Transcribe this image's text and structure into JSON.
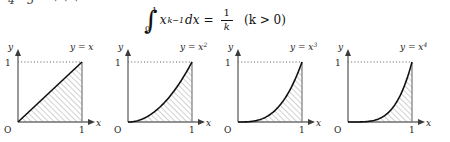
{
  "top_fragment": {
    "visible_digits": [
      "4",
      "5"
    ],
    "trailing_dots": "· · ·"
  },
  "formula": {
    "integral_symbol": "∫",
    "lower_limit": "0",
    "upper_limit": "1",
    "integrand_base": "x",
    "integrand_exponent": "k−1",
    "differential": "dx",
    "equals": "=",
    "result_numerator": "1",
    "result_denominator": "k",
    "condition": "(k > 0)"
  },
  "panels": [
    {
      "id": "panel-y-equals-x",
      "curve_label_lhs": "y = x",
      "curve_label_exponent": "",
      "exponent": 1,
      "y_axis_label": "y",
      "x_axis_label": "x",
      "origin_label": "O",
      "y_tick_label": "1",
      "x_tick_label": "1"
    },
    {
      "id": "panel-y-equals-x2",
      "curve_label_lhs": "y = x",
      "curve_label_exponent": "2",
      "exponent": 2,
      "y_axis_label": "y",
      "x_axis_label": "x",
      "origin_label": "O",
      "y_tick_label": "1",
      "x_tick_label": "1"
    },
    {
      "id": "panel-y-equals-x3",
      "curve_label_lhs": "y = x",
      "curve_label_exponent": "3",
      "exponent": 3,
      "y_axis_label": "y",
      "x_axis_label": "x",
      "origin_label": "O",
      "y_tick_label": "1",
      "x_tick_label": "1"
    },
    {
      "id": "panel-y-equals-x4",
      "curve_label_lhs": "y = x",
      "curve_label_exponent": "4",
      "exponent": 4,
      "y_axis_label": "y",
      "x_axis_label": "x",
      "origin_label": "O",
      "y_tick_label": "1",
      "x_tick_label": "1"
    }
  ],
  "colors": {
    "background": "#ffffff",
    "axis": "#6e6e6e",
    "curve": "#111111",
    "hatch": "#9a9a9a",
    "text": "#1a1a1a"
  }
}
